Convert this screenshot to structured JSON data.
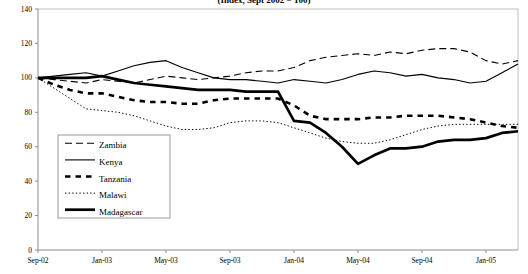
{
  "chart_data": {
    "type": "line",
    "title": "(Index, Sept 2002 = 100)",
    "xlabel": "",
    "ylabel": "",
    "ylim": [
      0,
      140
    ],
    "ytickstep": 20,
    "yticks": [
      "0",
      "20",
      "40",
      "60",
      "80",
      "100",
      "120",
      "140"
    ],
    "grid": false,
    "legend_position": "inside-left-lower",
    "x": [
      "Sep-02",
      "Oct-02",
      "Nov-02",
      "Dec-02",
      "Jan-03",
      "Feb-03",
      "Mar-03",
      "Apr-03",
      "May-03",
      "Jun-03",
      "Jul-03",
      "Aug-03",
      "Sep-03",
      "Oct-03",
      "Nov-03",
      "Dec-03",
      "Jan-04",
      "Feb-04",
      "Mar-04",
      "Apr-04",
      "May-04",
      "Jun-04",
      "Jul-04",
      "Aug-04",
      "Sep-04",
      "Oct-04",
      "Nov-04",
      "Dec-04",
      "Jan-05",
      "Feb-05",
      "Mar-05"
    ],
    "xtick_labels": [
      "Sep-02",
      "Jan-03",
      "May-03",
      "Sep-03",
      "Jan-04",
      "May-04",
      "Sep-04",
      "Jan-05"
    ],
    "xtick_indices": [
      0,
      4,
      8,
      12,
      16,
      20,
      24,
      28
    ],
    "series": [
      {
        "name": "Zambia",
        "style": "dashed",
        "values": [
          100,
          99,
          98,
          97,
          99,
          98,
          97,
          99,
          101,
          100,
          99,
          100,
          101,
          103,
          104,
          104,
          106,
          110,
          112,
          113,
          114,
          113,
          115,
          114,
          116,
          117,
          117,
          115,
          110,
          108,
          110
        ]
      },
      {
        "name": "Kenya",
        "style": "solid-thin",
        "values": [
          100,
          101,
          102,
          103,
          101,
          104,
          107,
          109,
          110,
          106,
          103,
          100,
          99,
          99,
          98,
          97,
          99,
          98,
          97,
          99,
          102,
          104,
          103,
          101,
          102,
          100,
          99,
          97,
          98,
          103,
          108
        ]
      },
      {
        "name": "Tanzania",
        "style": "dashed-thick",
        "values": [
          100,
          96,
          93,
          91,
          91,
          89,
          87,
          86,
          86,
          85,
          85,
          87,
          88,
          88,
          88,
          88,
          84,
          78,
          76,
          76,
          76,
          77,
          77,
          78,
          78,
          78,
          77,
          76,
          74,
          72,
          71
        ]
      },
      {
        "name": "Malawi",
        "style": "dotted",
        "values": [
          100,
          94,
          88,
          82,
          81,
          80,
          78,
          75,
          72,
          70,
          70,
          71,
          74,
          75,
          75,
          74,
          71,
          68,
          65,
          63,
          62,
          62,
          64,
          67,
          70,
          72,
          73,
          73,
          73,
          73,
          73
        ]
      },
      {
        "name": "Madagascar",
        "style": "solid-thick",
        "values": [
          100,
          100,
          100,
          100,
          101,
          99,
          97,
          96,
          95,
          94,
          93,
          93,
          93,
          92,
          92,
          92,
          75,
          74,
          68,
          60,
          50,
          55,
          59,
          59,
          60,
          63,
          64,
          64,
          65,
          68,
          69
        ]
      }
    ]
  },
  "legend": {
    "items": [
      {
        "label": "Zambia"
      },
      {
        "label": "Kenya"
      },
      {
        "label": "Tanzania"
      },
      {
        "label": "Malawi"
      },
      {
        "label": "Madagascar"
      }
    ]
  }
}
